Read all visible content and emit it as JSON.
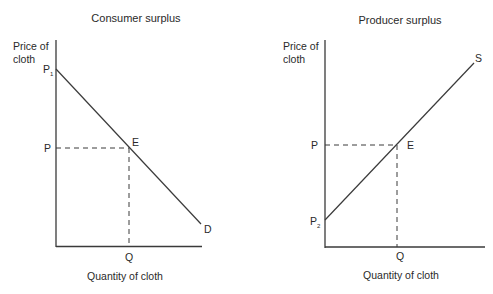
{
  "left": {
    "title": "Consumer surplus",
    "ylabel_line1": "Price of",
    "ylabel_line2": "cloth",
    "xlabel": "Quantity of cloth",
    "p_top": "P",
    "p_top_sub": "1",
    "p_label": "P",
    "q_label": "Q",
    "e_label": "E",
    "curve_label": "D"
  },
  "right": {
    "title": "Producer surplus",
    "ylabel_line1": "Price of",
    "ylabel_line2": "cloth",
    "xlabel": "Quantity of cloth",
    "p_bottom": "P",
    "p_bottom_sub": "2",
    "p_label": "P",
    "q_label": "Q",
    "e_label": "E",
    "curve_label": "S"
  },
  "colors": {
    "line": "#3a3a3a",
    "text": "#2a2a2a"
  }
}
